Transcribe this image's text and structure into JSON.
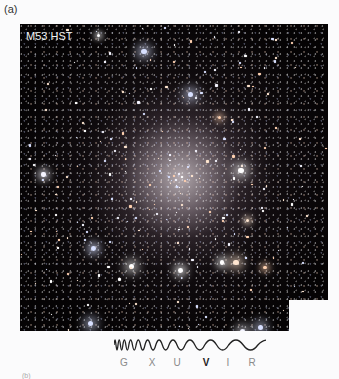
{
  "figure": {
    "panel_label": "(a)",
    "image_title": "M53 HST",
    "image_description": "Hubble Space Telescope image of globular cluster M53",
    "next_panel_label": "(b)"
  },
  "spectrum": {
    "bands": [
      {
        "label": "G",
        "x": 10,
        "bold": false
      },
      {
        "label": "X",
        "x": 38,
        "bold": false
      },
      {
        "label": "U",
        "x": 63,
        "bold": false
      },
      {
        "label": "V",
        "x": 92,
        "bold": true
      },
      {
        "label": "I",
        "x": 114,
        "bold": false
      },
      {
        "label": "R",
        "x": 138,
        "bold": false
      }
    ],
    "wave_color": "#222222"
  },
  "colors": {
    "background": "#fbfbfc",
    "image_bg": "#050304",
    "title_text": "#f2f2f2"
  }
}
